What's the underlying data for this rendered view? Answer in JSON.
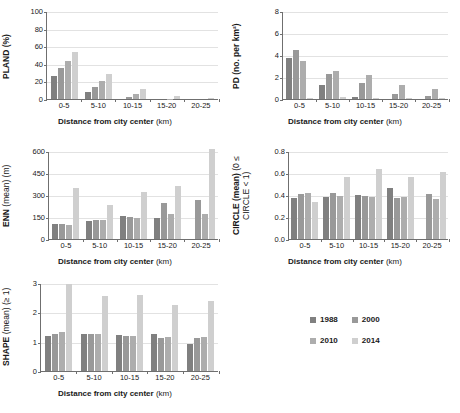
{
  "figure": {
    "categories": [
      "0-5",
      "5-10",
      "10-15",
      "15-20",
      "20-25"
    ],
    "xlabel_bold": "Distance from city center",
    "xlabel_unit": "(km)",
    "legend": {
      "entries": [
        {
          "label": "1988",
          "color": "#808080"
        },
        {
          "label": "2000",
          "color": "#999999"
        },
        {
          "label": "2010",
          "color": "#adadad"
        },
        {
          "label": "2014",
          "color": "#cfcfcf"
        }
      ]
    }
  },
  "chart_data": [
    {
      "id": "pland",
      "type": "bar",
      "title": "",
      "ylabel": "PLAND (%)",
      "ylabel_main": "PLAND (%)",
      "ylabel_sub": "",
      "xlabel": "Distance from city center (km)",
      "categories": [
        "0-5",
        "5-10",
        "10-15",
        "15-20",
        "20-25"
      ],
      "ylim": [
        0,
        100
      ],
      "yticks": [
        0,
        20,
        40,
        60,
        80,
        100
      ],
      "ytick_labels": [
        "0",
        "20",
        "40",
        "60",
        "80",
        "100"
      ],
      "grid": true,
      "legend_position": "external-bottom-right",
      "series": [
        {
          "name": "1988",
          "values": [
            26,
            7.5,
            0,
            0,
            0
          ]
        },
        {
          "name": "2000",
          "values": [
            35.5,
            13.5,
            2,
            0,
            0
          ]
        },
        {
          "name": "2010",
          "values": [
            43.5,
            20.5,
            6,
            0.5,
            0
          ]
        },
        {
          "name": "2014",
          "values": [
            53,
            28,
            11,
            3,
            1
          ]
        }
      ]
    },
    {
      "id": "pd",
      "type": "bar",
      "title": "",
      "ylabel": "PD (no. per km²)",
      "ylabel_main": "PD (no. per km²)",
      "ylabel_sub": "",
      "xlabel": "Distance from city center (km)",
      "categories": [
        "0-5",
        "5-10",
        "10-15",
        "15-20",
        "20-25"
      ],
      "ylim": [
        0,
        8
      ],
      "yticks": [
        0,
        2,
        4,
        6,
        8
      ],
      "ytick_labels": [
        "0",
        "2",
        "4",
        "6",
        "8"
      ],
      "grid": true,
      "legend_position": "external-bottom-right",
      "series": [
        {
          "name": "1988",
          "values": [
            3.7,
            1.3,
            0.2,
            0.0,
            0.0
          ]
        },
        {
          "name": "2000",
          "values": [
            4.45,
            2.25,
            1.5,
            0.5,
            0.3
          ]
        },
        {
          "name": "2010",
          "values": [
            3.45,
            2.55,
            2.15,
            1.25,
            0.9
          ]
        },
        {
          "name": "2014",
          "values": [
            0.1,
            0.15,
            0.1,
            0.1,
            0.05
          ]
        }
      ]
    },
    {
      "id": "enn",
      "type": "bar",
      "title": "",
      "ylabel": "ENN (mean) (m)",
      "ylabel_main": "ENN",
      "ylabel_sub": "(mean) (m)",
      "xlabel": "Distance from city center (km)",
      "categories": [
        "0-5",
        "5-10",
        "10-15",
        "15-20",
        "20-25"
      ],
      "ylim": [
        0,
        600
      ],
      "yticks": [
        0,
        150,
        300,
        450,
        600
      ],
      "ytick_labels": [
        "0",
        "150",
        "300",
        "450",
        "600"
      ],
      "grid": true,
      "legend_position": "external-bottom-right",
      "series": [
        {
          "name": "1988",
          "values": [
            103,
            122,
            157,
            145,
            0
          ]
        },
        {
          "name": "2000",
          "values": [
            103,
            133,
            148,
            243,
            265
          ]
        },
        {
          "name": "2010",
          "values": [
            98,
            130,
            145,
            168,
            170
          ]
        },
        {
          "name": "2014",
          "values": [
            348,
            233,
            322,
            360,
            615
          ]
        }
      ]
    },
    {
      "id": "circle",
      "type": "bar",
      "title": "",
      "ylabel": "CIRCLE (mean) (0 ≤ CIRCLE < 1)",
      "ylabel_main": "CIRCLE (mean)",
      "ylabel_sub": "(0 ≤ CIRCLE < 1)",
      "xlabel": "Distance from city center (km)",
      "categories": [
        "0-5",
        "5-10",
        "10-15",
        "15-20",
        "20-25"
      ],
      "ylim": [
        0,
        0.8
      ],
      "yticks": [
        0.0,
        0.2,
        0.4,
        0.6,
        0.8
      ],
      "ytick_labels": [
        "0.0",
        "0.2",
        "0.4",
        "0.6",
        "0.8"
      ],
      "grid": true,
      "legend_position": "external-bottom-right",
      "series": [
        {
          "name": "1988",
          "values": [
            0.37,
            0.385,
            0.4,
            0.46,
            0.0
          ]
        },
        {
          "name": "2000",
          "values": [
            0.41,
            0.42,
            0.395,
            0.375,
            0.41
          ]
        },
        {
          "name": "2010",
          "values": [
            0.415,
            0.39,
            0.385,
            0.38,
            0.36
          ]
        },
        {
          "name": "2014",
          "values": [
            0.34,
            0.565,
            0.64,
            0.565,
            0.605
          ]
        }
      ]
    },
    {
      "id": "shape",
      "type": "bar",
      "title": "",
      "ylabel": "SHAPE (mean) (≥ 1)",
      "ylabel_main": "SHAPE",
      "ylabel_sub": "(mean) (≥ 1)",
      "xlabel": "Distance from city center (km)",
      "categories": [
        "0-5",
        "5-10",
        "10-15",
        "15-20",
        "20-25"
      ],
      "ylim": [
        0,
        3
      ],
      "yticks": [
        0,
        1,
        2,
        3
      ],
      "ytick_labels": [
        "0",
        "1",
        "2",
        "3"
      ],
      "grid": true,
      "legend_position": "external-bottom-right",
      "series": [
        {
          "name": "1988",
          "values": [
            1.21,
            1.26,
            1.23,
            1.27,
            0.93
          ]
        },
        {
          "name": "2000",
          "values": [
            1.25,
            1.27,
            1.21,
            1.12,
            1.14
          ]
        },
        {
          "name": "2010",
          "values": [
            1.32,
            1.26,
            1.21,
            1.15,
            1.16
          ]
        },
        {
          "name": "2014",
          "values": [
            2.97,
            2.56,
            2.6,
            2.26,
            2.4
          ]
        }
      ]
    }
  ]
}
